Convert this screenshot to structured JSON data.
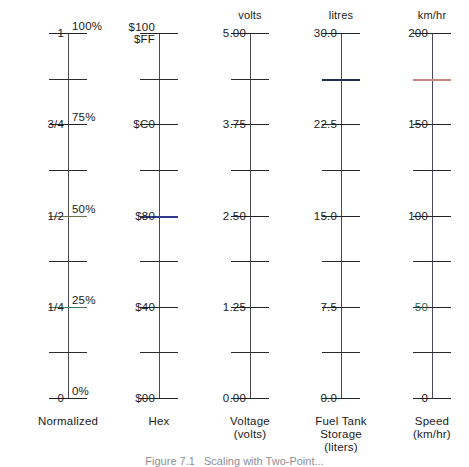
{
  "figure": {
    "caption": "Figure 7.1   Scaling with Two-Point...",
    "caption_top": 455,
    "axis": {
      "top": 33,
      "bottom": 398,
      "divisions": 8
    },
    "colors": {
      "line": "#2a2a33",
      "blue": "#2d3c8c",
      "navy": "#1d2f55",
      "red": "#c08a80",
      "green": "#2f6b46"
    }
  },
  "scales": [
    {
      "id": "normalized",
      "left": 8,
      "unit": "",
      "axis_caption": "Normalized",
      "left_labels": [
        {
          "text": "1",
          "div": 0,
          "color": ""
        },
        {
          "text": "3/4",
          "div": 2,
          "color": ""
        },
        {
          "text": "1/2",
          "div": 4,
          "color": ""
        },
        {
          "text": "1/4",
          "div": 6,
          "color": ""
        },
        {
          "text": "0",
          "div": 8,
          "color": ""
        }
      ],
      "right_labels": [
        {
          "text": "100%",
          "div": 0,
          "color": ""
        },
        {
          "text": "75%",
          "div": 2,
          "color": ""
        },
        {
          "text": "50%",
          "div": 4,
          "color": ""
        },
        {
          "text": "25%",
          "div": 6,
          "color": ""
        },
        {
          "text": "0%",
          "div": 8,
          "color": ""
        }
      ],
      "ticks": [
        {
          "div": 0,
          "kind": "major"
        },
        {
          "div": 1,
          "kind": "minor"
        },
        {
          "div": 2,
          "kind": "major"
        },
        {
          "div": 3,
          "kind": "minor"
        },
        {
          "div": 4,
          "kind": "olive"
        },
        {
          "div": 5,
          "kind": "minor"
        },
        {
          "div": 6,
          "kind": "green"
        },
        {
          "div": 7,
          "kind": "minor"
        },
        {
          "div": 8,
          "kind": "major"
        }
      ]
    },
    {
      "id": "hex",
      "left": 99,
      "unit": "",
      "axis_caption": "Hex",
      "left_labels": [
        {
          "text": "$100\n$FF",
          "div": 0,
          "color": ""
        },
        {
          "text": "$C0",
          "div": 2,
          "color": ""
        },
        {
          "text": "$80",
          "div": 4,
          "color": ""
        },
        {
          "text": "$40",
          "div": 6,
          "color": ""
        },
        {
          "text": "$00",
          "div": 8,
          "color": ""
        }
      ],
      "right_labels": [],
      "ticks": [
        {
          "div": 0,
          "kind": "major"
        },
        {
          "div": 1,
          "kind": "minor"
        },
        {
          "div": 2,
          "kind": "major"
        },
        {
          "div": 3,
          "kind": "minor"
        },
        {
          "div": 4,
          "kind": "blue"
        },
        {
          "div": 5,
          "kind": "minor"
        },
        {
          "div": 6,
          "kind": "major"
        },
        {
          "div": 7,
          "kind": "minor"
        },
        {
          "div": 8,
          "kind": "major"
        }
      ]
    },
    {
      "id": "voltage",
      "left": 190,
      "unit": "volts",
      "axis_caption": "Voltage\n(volts)",
      "left_labels": [
        {
          "text": "5.00",
          "div": 0,
          "color": ""
        },
        {
          "text": "3.75",
          "div": 2,
          "color": ""
        },
        {
          "text": "2.50",
          "div": 4,
          "color": ""
        },
        {
          "text": "1.25",
          "div": 6,
          "color": ""
        },
        {
          "text": "0.00",
          "div": 8,
          "color": ""
        }
      ],
      "right_labels": [],
      "ticks": [
        {
          "div": 0,
          "kind": "major"
        },
        {
          "div": 1,
          "kind": "minor"
        },
        {
          "div": 2,
          "kind": "major"
        },
        {
          "div": 3,
          "kind": "minor"
        },
        {
          "div": 4,
          "kind": "major"
        },
        {
          "div": 5,
          "kind": "minor"
        },
        {
          "div": 6,
          "kind": "major"
        },
        {
          "div": 7,
          "kind": "minor"
        },
        {
          "div": 8,
          "kind": "major"
        }
      ]
    },
    {
      "id": "fuel-tank",
      "left": 281,
      "unit": "litres",
      "axis_caption": "Fuel Tank\nStorage\n(liters)",
      "left_labels": [
        {
          "text": "30.0",
          "div": 0,
          "color": ""
        },
        {
          "text": "22.5",
          "div": 2,
          "color": ""
        },
        {
          "text": "15.0",
          "div": 4,
          "color": ""
        },
        {
          "text": "7.5",
          "div": 6,
          "color": ""
        },
        {
          "text": "0.0",
          "div": 8,
          "color": ""
        }
      ],
      "right_labels": [],
      "ticks": [
        {
          "div": 0,
          "kind": "major"
        },
        {
          "div": 1,
          "kind": "navy"
        },
        {
          "div": 2,
          "kind": "major"
        },
        {
          "div": 3,
          "kind": "minor"
        },
        {
          "div": 4,
          "kind": "major"
        },
        {
          "div": 5,
          "kind": "minor"
        },
        {
          "div": 6,
          "kind": "major"
        },
        {
          "div": 7,
          "kind": "minor"
        },
        {
          "div": 8,
          "kind": "major"
        }
      ]
    },
    {
      "id": "speed",
      "left": 372,
      "unit": "km/hr",
      "axis_caption": "Speed\n(km/hr)",
      "left_labels": [
        {
          "text": "200",
          "div": 0,
          "color": ""
        },
        {
          "text": "150",
          "div": 2,
          "color": ""
        },
        {
          "text": "100",
          "div": 4,
          "color": ""
        },
        {
          "text": "50",
          "div": 6,
          "color": "green"
        },
        {
          "text": "0",
          "div": 8,
          "color": ""
        }
      ],
      "right_labels": [],
      "ticks": [
        {
          "div": 0,
          "kind": "major"
        },
        {
          "div": 1,
          "kind": "red"
        },
        {
          "div": 2,
          "kind": "major"
        },
        {
          "div": 3,
          "kind": "minor"
        },
        {
          "div": 4,
          "kind": "major"
        },
        {
          "div": 5,
          "kind": "minor"
        },
        {
          "div": 6,
          "kind": "major"
        },
        {
          "div": 7,
          "kind": "minor"
        },
        {
          "div": 8,
          "kind": "major"
        }
      ]
    }
  ],
  "chart_data": {
    "type": "table",
    "categories": [
      "Normalized",
      "Hex",
      "Voltage (volts)",
      "Fuel Tank Storage (liters)",
      "Speed (km/hr)"
    ],
    "grid": false,
    "legend": "none",
    "series": [
      {
        "name": "Normalized",
        "values": [
          1,
          0.75,
          0.5,
          0.25,
          0
        ],
        "tick_labels": [
          "1",
          "3/4",
          "1/2",
          "1/4",
          "0"
        ],
        "secondary_tick_labels": [
          "100%",
          "75%",
          "50%",
          "25%",
          "0%"
        ],
        "ylim": [
          0,
          1
        ],
        "unit": ""
      },
      {
        "name": "Hex",
        "values": [
          256,
          192,
          128,
          64,
          0
        ],
        "tick_labels": [
          "$100\n$FF",
          "$C0",
          "$80",
          "$40",
          "$00"
        ],
        "ylim": [
          0,
          256
        ],
        "unit": ""
      },
      {
        "name": "Voltage",
        "values": [
          5.0,
          3.75,
          2.5,
          1.25,
          0.0
        ],
        "tick_labels": [
          "5.00",
          "3.75",
          "2.50",
          "1.25",
          "0.00"
        ],
        "ylim": [
          0,
          5
        ],
        "unit": "volts"
      },
      {
        "name": "Fuel Tank Storage",
        "values": [
          30.0,
          22.5,
          15.0,
          7.5,
          0.0
        ],
        "tick_labels": [
          "30.0",
          "22.5",
          "15.0",
          "7.5",
          "0.0"
        ],
        "ylim": [
          0,
          30
        ],
        "unit": "litres"
      },
      {
        "name": "Speed",
        "values": [
          200,
          150,
          100,
          50,
          0
        ],
        "tick_labels": [
          "200",
          "150",
          "100",
          "50",
          "0"
        ],
        "ylim": [
          0,
          200
        ],
        "unit": "km/hr"
      }
    ]
  }
}
